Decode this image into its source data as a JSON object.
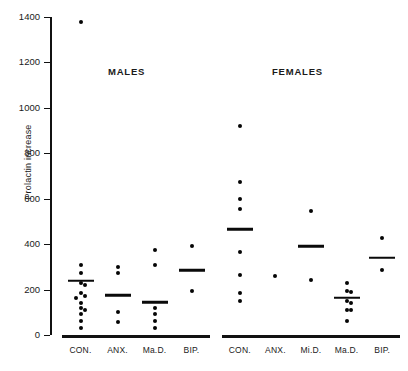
{
  "chart_data": {
    "type": "scatter",
    "title": "",
    "xlabel": "",
    "ylabel": "Prolactin increase",
    "ylim": [
      0,
      1400
    ],
    "yticks": [
      0,
      200,
      400,
      600,
      800,
      1000,
      1200,
      1400
    ],
    "ytick_labels": [
      "0",
      "200",
      "400",
      "600",
      "800",
      "1000",
      "1200",
      "1400"
    ],
    "grid": false,
    "legend": "none",
    "panels": [
      {
        "name": "males",
        "title": "MALES",
        "groups": [
          {
            "label": "CON.",
            "mean": 238,
            "values": [
              1380,
              310,
              272,
              228,
              222,
              185,
              172,
              165,
              142,
              120,
              112,
              92,
              60,
              30
            ]
          },
          {
            "label": "ANX.",
            "mean": 175,
            "values": [
              300,
              272,
              100,
              58
            ]
          },
          {
            "label": "Ma.D.",
            "mean": 145,
            "values": [
              375,
              310,
              118,
              92,
              62,
              30
            ]
          },
          {
            "label": "BIP.",
            "mean": 285,
            "values": [
              390,
              195
            ]
          }
        ]
      },
      {
        "name": "females",
        "title": "FEMALES",
        "groups": [
          {
            "label": "CON.",
            "mean": 465,
            "values": [
              920,
              675,
              600,
              555,
              365,
              265,
              185,
              150
            ]
          },
          {
            "label": "ANX.",
            "mean": null,
            "values": [
              258
            ]
          },
          {
            "label": "Mi.D.",
            "mean": 390,
            "values": [
              548,
              240
            ]
          },
          {
            "label": "Ma.D.",
            "mean": 165,
            "values": [
              230,
              195,
              190,
              148,
              142,
              112,
              108,
              62
            ]
          },
          {
            "label": "BIP.",
            "mean": 340,
            "values": [
              425,
              285
            ]
          }
        ]
      }
    ]
  },
  "axis": {
    "y_title": "Prolactin increase"
  }
}
